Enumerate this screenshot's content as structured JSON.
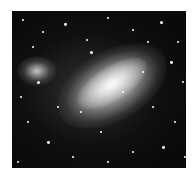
{
  "image": {
    "subject": "galaxy-photograph",
    "description": "Grayscale astronomical photograph of an irregular barred galaxy with a bright diagonal bar and star-forming region at left",
    "colors": {
      "background": "#ffffff",
      "sky": "#0a0a0a",
      "bar": "#e8e8e8"
    }
  },
  "stars": [
    [
      10,
      8,
      1.2
    ],
    [
      30,
      20,
      1
    ],
    [
      52,
      12,
      1.4
    ],
    [
      74,
      28,
      1
    ],
    [
      95,
      6,
      1.2
    ],
    [
      120,
      18,
      1
    ],
    [
      148,
      10,
      1.6
    ],
    [
      165,
      30,
      1.2
    ],
    [
      158,
      50,
      1.4
    ],
    [
      170,
      70,
      1
    ],
    [
      140,
      95,
      1.2
    ],
    [
      162,
      110,
      1
    ],
    [
      150,
      135,
      1.4
    ],
    [
      120,
      140,
      1
    ],
    [
      95,
      150,
      1.2
    ],
    [
      60,
      145,
      1
    ],
    [
      35,
      130,
      1.4
    ],
    [
      15,
      110,
      1
    ],
    [
      8,
      85,
      1.2
    ],
    [
      25,
      70,
      1.6
    ],
    [
      78,
      40,
      1.6
    ],
    [
      130,
      60,
      1.2
    ],
    [
      110,
      80,
      1
    ],
    [
      88,
      120,
      1.2
    ],
    [
      45,
      95,
      1
    ],
    [
      20,
      35,
      1.2
    ],
    [
      135,
      30,
      1
    ],
    [
      172,
      145,
      1
    ],
    [
      5,
      150,
      1.2
    ],
    [
      68,
      100,
      1
    ]
  ]
}
